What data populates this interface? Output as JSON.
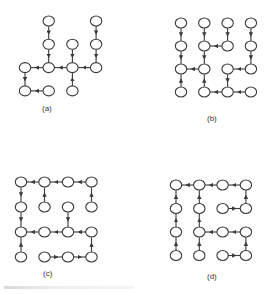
{
  "figure": {
    "panels": [
      {
        "id": "a",
        "label": "(a)",
        "grid": "4x4",
        "nodes": [
          [
            1,
            0
          ],
          [
            1,
            1
          ],
          [
            1,
            2
          ],
          [
            3,
            0
          ],
          [
            3,
            1
          ],
          [
            3,
            2
          ],
          [
            2,
            1
          ],
          [
            2,
            2
          ],
          [
            2,
            3
          ],
          [
            0,
            2
          ],
          [
            0,
            3
          ],
          [
            1,
            3
          ]
        ],
        "edges": [
          [
            [
              1,
              0
            ],
            [
              1,
              1
            ]
          ],
          [
            [
              1,
              1
            ],
            [
              1,
              2
            ]
          ],
          [
            [
              1,
              2
            ],
            [
              0,
              2
            ]
          ],
          [
            [
              2,
              2
            ],
            [
              1,
              2
            ]
          ],
          [
            [
              3,
              2
            ],
            [
              2,
              2
            ]
          ],
          [
            [
              2,
              1
            ],
            [
              2,
              2
            ]
          ],
          [
            [
              2,
              3
            ],
            [
              2,
              2
            ]
          ],
          [
            [
              3,
              0
            ],
            [
              3,
              1
            ]
          ],
          [
            [
              3,
              1
            ],
            [
              3,
              2
            ]
          ],
          [
            [
              0,
              2
            ],
            [
              0,
              3
            ]
          ],
          [
            [
              1,
              3
            ],
            [
              0,
              3
            ]
          ]
        ]
      },
      {
        "id": "b",
        "label": "(b)",
        "grid": "4x4",
        "nodes": [
          [
            0,
            0
          ],
          [
            1,
            0
          ],
          [
            2,
            0
          ],
          [
            3,
            0
          ],
          [
            0,
            1
          ],
          [
            1,
            1
          ],
          [
            2,
            1
          ],
          [
            3,
            1
          ],
          [
            0,
            2
          ],
          [
            1,
            2
          ],
          [
            2,
            2
          ],
          [
            3,
            2
          ],
          [
            0,
            3
          ],
          [
            1,
            3
          ],
          [
            2,
            3
          ],
          [
            3,
            3
          ]
        ],
        "edges": [
          [
            [
              0,
              0
            ],
            [
              0,
              1
            ]
          ],
          [
            [
              0,
              1
            ],
            [
              0,
              2
            ]
          ],
          [
            [
              0,
              3
            ],
            [
              0,
              2
            ]
          ],
          [
            [
              1,
              2
            ],
            [
              0,
              2
            ]
          ],
          [
            [
              1,
              0
            ],
            [
              1,
              1
            ]
          ],
          [
            [
              2,
              1
            ],
            [
              1,
              1
            ]
          ],
          [
            [
              1,
              1
            ],
            [
              1,
              2
            ]
          ],
          [
            [
              2,
              0
            ],
            [
              2,
              1
            ]
          ],
          [
            [
              1,
              3
            ],
            [
              1,
              2
            ]
          ],
          [
            [
              2,
              3
            ],
            [
              1,
              3
            ]
          ],
          [
            [
              3,
              3
            ],
            [
              2,
              3
            ]
          ],
          [
            [
              2,
              2
            ],
            [
              2,
              3
            ]
          ],
          [
            [
              3,
              2
            ],
            [
              2,
              2
            ]
          ],
          [
            [
              3,
              1
            ],
            [
              3,
              2
            ]
          ],
          [
            [
              3,
              0
            ],
            [
              3,
              1
            ]
          ]
        ]
      },
      {
        "id": "c",
        "label": "(c)",
        "grid": "4x4",
        "nodes": [
          [
            0,
            0
          ],
          [
            1,
            0
          ],
          [
            2,
            0
          ],
          [
            3,
            0
          ],
          [
            0,
            1
          ],
          [
            1,
            1
          ],
          [
            2,
            1
          ],
          [
            3,
            1
          ],
          [
            0,
            2
          ],
          [
            1,
            2
          ],
          [
            2,
            2
          ],
          [
            3,
            2
          ],
          [
            0,
            3
          ],
          [
            1,
            3
          ],
          [
            2,
            3
          ],
          [
            3,
            3
          ]
        ],
        "edges": [
          [
            [
              1,
              0
            ],
            [
              0,
              0
            ]
          ],
          [
            [
              2,
              0
            ],
            [
              1,
              0
            ]
          ],
          [
            [
              3,
              0
            ],
            [
              2,
              0
            ]
          ],
          [
            [
              3,
              1
            ],
            [
              3,
              0
            ]
          ],
          [
            [
              1,
              1
            ],
            [
              1,
              0
            ]
          ],
          [
            [
              0,
              0
            ],
            [
              0,
              1
            ]
          ],
          [
            [
              0,
              1
            ],
            [
              0,
              2
            ]
          ],
          [
            [
              1,
              2
            ],
            [
              0,
              2
            ]
          ],
          [
            [
              0,
              3
            ],
            [
              0,
              2
            ]
          ],
          [
            [
              2,
              2
            ],
            [
              1,
              2
            ]
          ],
          [
            [
              2,
              1
            ],
            [
              2,
              2
            ]
          ],
          [
            [
              3,
              2
            ],
            [
              2,
              2
            ]
          ],
          [
            [
              3,
              3
            ],
            [
              3,
              2
            ]
          ],
          [
            [
              2,
              3
            ],
            [
              3,
              3
            ]
          ],
          [
            [
              1,
              3
            ],
            [
              2,
              3
            ]
          ]
        ]
      },
      {
        "id": "d",
        "label": "(d)",
        "grid": "4x4",
        "nodes": [
          [
            0,
            0
          ],
          [
            1,
            0
          ],
          [
            2,
            0
          ],
          [
            3,
            0
          ],
          [
            0,
            1
          ],
          [
            1,
            1
          ],
          [
            2,
            1
          ],
          [
            3,
            1
          ],
          [
            0,
            2
          ],
          [
            1,
            2
          ],
          [
            2,
            2
          ],
          [
            3,
            2
          ],
          [
            0,
            3
          ],
          [
            1,
            3
          ],
          [
            2,
            3
          ],
          [
            3,
            3
          ]
        ],
        "edges": [
          [
            [
              1,
              0
            ],
            [
              0,
              0
            ]
          ],
          [
            [
              2,
              0
            ],
            [
              1,
              0
            ]
          ],
          [
            [
              3,
              0
            ],
            [
              2,
              0
            ]
          ],
          [
            [
              3,
              1
            ],
            [
              3,
              0
            ]
          ],
          [
            [
              2,
              1
            ],
            [
              3,
              1
            ]
          ],
          [
            [
              0,
              1
            ],
            [
              0,
              0
            ]
          ],
          [
            [
              0,
              2
            ],
            [
              0,
              1
            ]
          ],
          [
            [
              0,
              3
            ],
            [
              0,
              2
            ]
          ],
          [
            [
              1,
              1
            ],
            [
              1,
              0
            ]
          ],
          [
            [
              1,
              2
            ],
            [
              1,
              1
            ]
          ],
          [
            [
              1,
              3
            ],
            [
              1,
              2
            ]
          ],
          [
            [
              2,
              2
            ],
            [
              1,
              2
            ]
          ],
          [
            [
              3,
              2
            ],
            [
              2,
              2
            ]
          ],
          [
            [
              3,
              3
            ],
            [
              3,
              2
            ]
          ],
          [
            [
              2,
              3
            ],
            [
              3,
              3
            ]
          ]
        ]
      }
    ]
  }
}
